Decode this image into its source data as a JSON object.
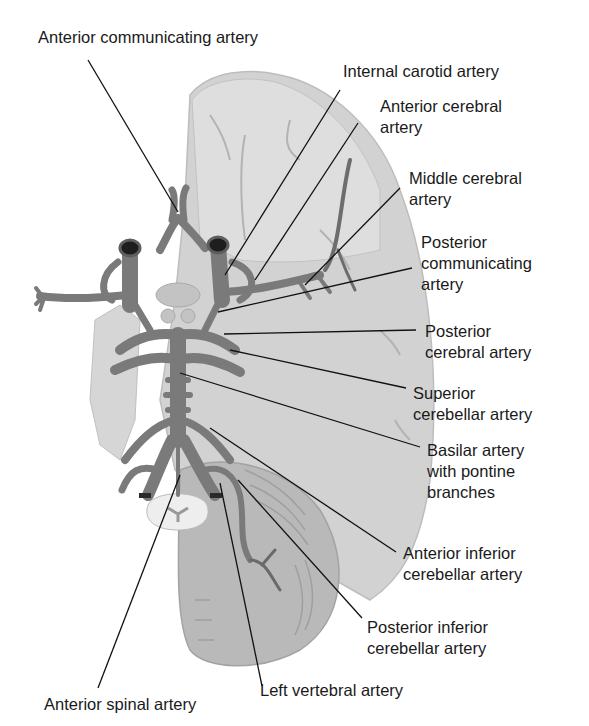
{
  "figure": {
    "colors": {
      "background": "#ffffff",
      "brain_fill": "#cfcfcf",
      "brain_light": "#dcdcdc",
      "cerebellum_fill": "#b8b8b8",
      "artery_fill": "#7a7a7a",
      "artery_dark": "#5e5e5e",
      "vessel_lumen": "#1e1e1e",
      "leader_line": "#111111",
      "label_text": "#1a1a1a"
    }
  },
  "labels": {
    "anterior_communicating": "Anterior communicating artery",
    "internal_carotid": "Internal carotid artery",
    "anterior_cerebral": "Anterior cerebral\nartery",
    "middle_cerebral": "Middle cerebral\nartery",
    "posterior_communicating": "Posterior\ncommunicating\nartery",
    "posterior_cerebral": "Posterior\ncerebral artery",
    "superior_cerebellar": "Superior\ncerebellar artery",
    "basilar": "Basilar artery\nwith pontine\nbranches",
    "anterior_inferior_cerebellar": "Anterior inferior\ncerebellar artery",
    "posterior_inferior_cerebellar": "Posterior inferior\ncerebellar artery",
    "left_vertebral": "Left vertebral artery",
    "anterior_spinal": "Anterior spinal artery"
  }
}
